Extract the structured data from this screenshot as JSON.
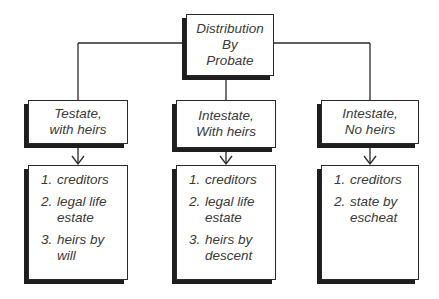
{
  "root": {
    "lines": [
      "Distribution",
      "By",
      "Probate"
    ]
  },
  "branches": [
    {
      "heading": [
        "Testate,",
        "with heirs"
      ],
      "items": [
        {
          "num": "1.",
          "text": "creditors"
        },
        {
          "num": "2.",
          "text": "legal life estate"
        },
        {
          "num": "3.",
          "text": "heirs by will"
        }
      ]
    },
    {
      "heading": [
        "Intestate,",
        "With heirs"
      ],
      "items": [
        {
          "num": "1.",
          "text": "creditors"
        },
        {
          "num": "2.",
          "text": "legal life estate"
        },
        {
          "num": "3.",
          "text": "heirs by descent"
        }
      ]
    },
    {
      "heading": [
        "Intestate,",
        "No heirs"
      ],
      "items": [
        {
          "num": "1.",
          "text": "creditors"
        },
        {
          "num": "2.",
          "text": "state by escheat"
        }
      ]
    }
  ],
  "colors": {
    "line": "#2a2a2a",
    "shadow": "#1e1e1e",
    "text": "#3a3a3a"
  }
}
